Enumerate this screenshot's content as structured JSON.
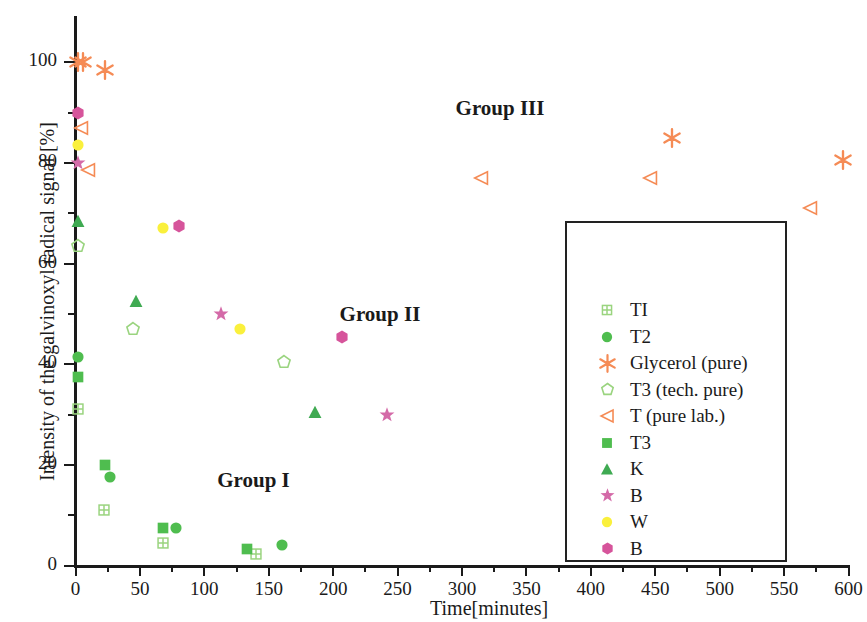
{
  "chart_data": {
    "type": "scatter",
    "title": "",
    "xlabel": "Time[minutes]",
    "ylabel": "Intensity of the galvinoxyl radical signal [%]",
    "xlim": [
      0,
      600
    ],
    "ylim": [
      0,
      108
    ],
    "xticks": [
      0,
      50,
      100,
      150,
      200,
      250,
      300,
      350,
      400,
      450,
      500,
      550,
      600
    ],
    "xtick_labels": [
      "0",
      "50",
      "100",
      "150",
      "200",
      "250",
      "300",
      "350",
      "400",
      "450",
      "500",
      "550",
      "600"
    ],
    "xminor_step": 25,
    "yticks": [
      0,
      20,
      40,
      60,
      80,
      100
    ],
    "ytick_labels": [
      "0",
      "20",
      "40",
      "60",
      "80",
      "100"
    ],
    "yminor_step": 10,
    "grid": false,
    "legend_position": "center-right",
    "annotations": [
      {
        "text": "Group III",
        "x": 295,
        "y": 90.5
      },
      {
        "text": "Group II",
        "x": 205,
        "y": 49.5
      },
      {
        "text": "Group I",
        "x": 110,
        "y": 16.5
      }
    ],
    "series": [
      {
        "name": "TI",
        "marker": "square-plus",
        "color": "#9ad47f",
        "fill": "none",
        "points": [
          [
            2,
            31
          ],
          [
            22,
            11
          ],
          [
            68,
            4.5
          ],
          [
            140,
            2.2
          ]
        ]
      },
      {
        "name": "T2",
        "marker": "circle",
        "color": "#4fbd4f",
        "fill": "solid",
        "points": [
          [
            2,
            41.5
          ],
          [
            27,
            17.5
          ],
          [
            78,
            7.5
          ],
          [
            160,
            4
          ]
        ]
      },
      {
        "name": "Glycerol (pure)",
        "marker": "asterisk",
        "color": "#f58b55",
        "fill": "solid",
        "points": [
          [
            2,
            100
          ],
          [
            6,
            100
          ],
          [
            23,
            98.5
          ],
          [
            463,
            85
          ],
          [
            596,
            80.5
          ]
        ]
      },
      {
        "name": "T3 (tech. pure)",
        "marker": "pentagon",
        "color": "#9ad47f",
        "fill": "none",
        "points": [
          [
            2,
            63.5
          ],
          [
            45,
            47
          ],
          [
            162,
            40.5
          ]
        ]
      },
      {
        "name": "T (pure lab.)",
        "marker": "triangle-left",
        "color": "#f58b55",
        "fill": "none",
        "points": [
          [
            4,
            87
          ],
          [
            10,
            78.5
          ],
          [
            315,
            77
          ],
          [
            446,
            77
          ],
          [
            570,
            71
          ]
        ]
      },
      {
        "name": "T3",
        "marker": "square",
        "color": "#4fbd4f",
        "fill": "solid",
        "points": [
          [
            2,
            37.5
          ],
          [
            23,
            20
          ],
          [
            68,
            7.5
          ],
          [
            133,
            3.2
          ]
        ]
      },
      {
        "name": "K",
        "marker": "triangle-up",
        "color": "#3faa52",
        "fill": "solid",
        "points": [
          [
            2,
            68.5
          ],
          [
            47,
            52.5
          ],
          [
            186,
            30.5
          ]
        ]
      },
      {
        "name": "B",
        "marker": "star",
        "color": "#d46aa8",
        "fill": "solid",
        "points": [
          [
            2,
            80
          ],
          [
            113,
            50
          ],
          [
            242,
            30
          ]
        ]
      },
      {
        "name": "W",
        "marker": "circle",
        "color": "#faf03c",
        "fill": "solid",
        "points": [
          [
            2,
            83.5
          ],
          [
            68,
            67
          ],
          [
            128,
            47
          ]
        ]
      },
      {
        "name": "B",
        "marker": "hexagon",
        "color": "#d6549b",
        "fill": "solid",
        "points": [
          [
            2,
            90
          ],
          [
            80,
            67.5
          ],
          [
            207,
            45.5
          ]
        ]
      }
    ]
  },
  "legend": {
    "entries": [
      {
        "label": "TI",
        "marker": "square-plus",
        "color": "#9ad47f",
        "fill": "none"
      },
      {
        "label": "T2",
        "marker": "circle",
        "color": "#4fbd4f",
        "fill": "solid"
      },
      {
        "label": "Glycerol (pure)",
        "marker": "asterisk",
        "color": "#f58b55",
        "fill": "solid"
      },
      {
        "label": "T3 (tech. pure)",
        "marker": "pentagon",
        "color": "#9ad47f",
        "fill": "none"
      },
      {
        "label": "T (pure lab.)",
        "marker": "triangle-left",
        "color": "#f58b55",
        "fill": "none"
      },
      {
        "label": "T3",
        "marker": "square",
        "color": "#4fbd4f",
        "fill": "solid"
      },
      {
        "label": "K",
        "marker": "triangle-up",
        "color": "#3faa52",
        "fill": "solid"
      },
      {
        "label": "B",
        "marker": "star",
        "color": "#d46aa8",
        "fill": "solid"
      },
      {
        "label": "W",
        "marker": "circle",
        "color": "#faf03c",
        "fill": "solid"
      },
      {
        "label": "B",
        "marker": "hexagon",
        "color": "#d6549b",
        "fill": "solid"
      }
    ]
  }
}
